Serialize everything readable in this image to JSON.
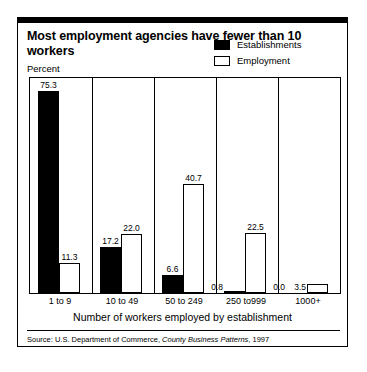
{
  "title": "Most employment agencies have fewer than 10 workers",
  "ylabel": "Percent",
  "xlabel": "Number of workers employed by establishment",
  "source": {
    "prefix": "Source: U.S. Department of Commerce, ",
    "publication": "County Business Patterns",
    "suffix": ", 1997"
  },
  "legend": [
    {
      "label": "Establishments",
      "style": "filled",
      "color": "#000000"
    },
    {
      "label": "Employment",
      "style": "hollow",
      "color": "#ffffff"
    }
  ],
  "chart_data": {
    "type": "bar",
    "title": "Most employment agencies have fewer than 10 workers",
    "xlabel": "Number of workers employed by establishment",
    "ylabel": "Percent",
    "ylim": [
      0,
      80
    ],
    "grid": false,
    "legend_position": "top-right",
    "categories": [
      "1 to 9",
      "10 to 49",
      "50 to 249",
      "250 to999",
      "1000+"
    ],
    "series": [
      {
        "name": "Establishments",
        "color": "#000000",
        "values": [
          75.3,
          17.2,
          6.6,
          0.8,
          0.0
        ],
        "labels": [
          "75.3",
          "17.2",
          "6.6",
          "0.8",
          "0.0"
        ]
      },
      {
        "name": "Employment",
        "color": "#ffffff",
        "values": [
          11.3,
          22.0,
          40.7,
          22.5,
          3.5
        ],
        "labels": [
          "11.3",
          "22.0",
          "40.7",
          "22.5",
          "3.5"
        ]
      }
    ]
  }
}
